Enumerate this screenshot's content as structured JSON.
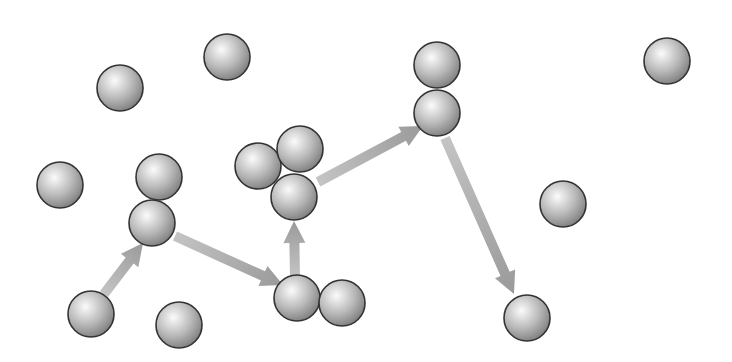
{
  "diagram": {
    "type": "particle-random-walk",
    "background": "#ffffff",
    "sphere_radius": 23,
    "colors": {
      "sphere_highlight": "#fbfbfb",
      "sphere_mid": "#b8b8b8",
      "sphere_shadow": "#7a7a7a",
      "sphere_outline": "#333333",
      "arrow": "#9a9a9a",
      "arrow_tail": "#c4c4c4"
    },
    "spheres": [
      {
        "x": 120,
        "y": 88
      },
      {
        "x": 227,
        "y": 57
      },
      {
        "x": 437,
        "y": 65
      },
      {
        "x": 437,
        "y": 113
      },
      {
        "x": 667,
        "y": 61
      },
      {
        "x": 60,
        "y": 185
      },
      {
        "x": 159,
        "y": 177
      },
      {
        "x": 152,
        "y": 223
      },
      {
        "x": 258,
        "y": 166
      },
      {
        "x": 300,
        "y": 149
      },
      {
        "x": 294,
        "y": 197
      },
      {
        "x": 563,
        "y": 204
      },
      {
        "x": 91,
        "y": 314
      },
      {
        "x": 179,
        "y": 325
      },
      {
        "x": 297,
        "y": 298
      },
      {
        "x": 342,
        "y": 303
      },
      {
        "x": 527,
        "y": 318
      }
    ],
    "arrows": [
      {
        "x1": 104,
        "y1": 294,
        "x2": 143,
        "y2": 243
      },
      {
        "x1": 175,
        "y1": 236,
        "x2": 283,
        "y2": 285
      },
      {
        "x1": 295,
        "y1": 277,
        "x2": 294,
        "y2": 221
      },
      {
        "x1": 318,
        "y1": 182,
        "x2": 423,
        "y2": 126
      },
      {
        "x1": 445,
        "y1": 138,
        "x2": 514,
        "y2": 294
      }
    ]
  }
}
